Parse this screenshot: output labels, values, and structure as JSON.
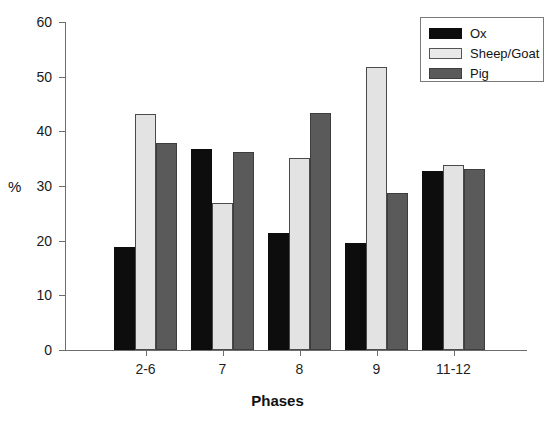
{
  "chart_data": {
    "type": "bar",
    "title": "",
    "xlabel": "Phases",
    "ylabel": "%",
    "ylim": [
      0,
      60
    ],
    "yticks": [
      0,
      10,
      20,
      30,
      40,
      50,
      60
    ],
    "grid": false,
    "legend_position": "top-right",
    "categories": [
      "2-6",
      "7",
      "8",
      "9",
      "11-12"
    ],
    "series": [
      {
        "name": "Ox",
        "color": "#0d0d0d",
        "values": [
          18.9,
          36.8,
          21.4,
          19.6,
          32.7
        ]
      },
      {
        "name": "Sheep/Goat",
        "color": "#e3e3e3",
        "values": [
          43.2,
          26.9,
          35.2,
          51.7,
          33.9
        ]
      },
      {
        "name": "Pig",
        "color": "#5a5a5a",
        "values": [
          37.9,
          36.2,
          43.3,
          28.7,
          33.2
        ]
      }
    ]
  },
  "legend": {
    "items": [
      {
        "label": "Ox"
      },
      {
        "label": "Sheep/Goat"
      },
      {
        "label": "Pig"
      }
    ]
  }
}
